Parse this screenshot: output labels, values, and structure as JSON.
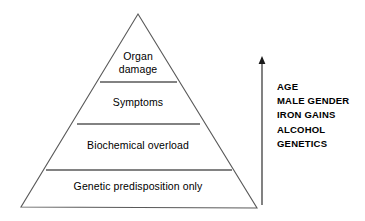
{
  "diagram": {
    "type": "pyramid",
    "title": "",
    "pyramid": {
      "apex": {
        "x": 138,
        "y": 14
      },
      "base_left": {
        "x": 21,
        "y": 207
      },
      "base_right": {
        "x": 257,
        "y": 208
      },
      "stroke_color": "#595959",
      "fill_color": "#ffffff",
      "tiers": [
        {
          "id": "organ-damage",
          "label": "Organ\ndamage",
          "level": 4,
          "divider_y": 82,
          "divider_x1": 100,
          "divider_x2": 177
        },
        {
          "id": "symptoms",
          "label": "Symptoms",
          "level": 3,
          "divider_y": 124,
          "divider_x1": 77,
          "divider_x2": 200
        },
        {
          "id": "biochemical-overload",
          "label": "Biochemical overload",
          "level": 2,
          "divider_y": 170,
          "divider_x1": 46,
          "divider_x2": 232
        },
        {
          "id": "genetic-predisposition",
          "label": "Genetic predisposition only",
          "level": 1,
          "divider_y": null,
          "divider_x1": null,
          "divider_x2": null
        }
      ]
    },
    "arrow": {
      "name": "upward-arrow",
      "direction": "up",
      "x": 262,
      "y_top": 57,
      "y_bottom": 205,
      "color": "#1a1a1a"
    },
    "risk_factors": {
      "items": [
        "AGE",
        "MALE GENDER",
        "IRON GAINS",
        "ALCOHOL",
        "GENETICS"
      ]
    }
  }
}
